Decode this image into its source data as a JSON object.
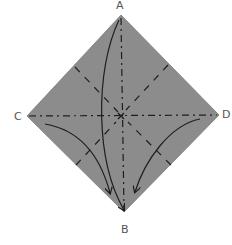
{
  "diagram": {
    "colors": {
      "paper": "#8c8c8c",
      "lines": "#1e1e1e",
      "labels": "#555555",
      "background": "#ffffff"
    },
    "vertices": {
      "A": {
        "label": "A",
        "x": 121,
        "y": 15
      },
      "B": {
        "label": "B",
        "x": 124,
        "y": 212
      },
      "C": {
        "label": "C",
        "x": 27,
        "y": 116
      },
      "D": {
        "label": "D",
        "x": 219,
        "y": 115
      }
    },
    "folds": [
      {
        "type": "mountain",
        "style": "dash-dot",
        "from": "C",
        "to": "D"
      },
      {
        "type": "mountain",
        "style": "dash-dot",
        "from": "A",
        "to": "B"
      },
      {
        "type": "valley",
        "style": "dashed",
        "from": "edge-AC-midpoint",
        "to": "center"
      },
      {
        "type": "valley",
        "style": "dashed",
        "from": "edge-AD-midpoint",
        "to": "center"
      },
      {
        "type": "valley",
        "style": "dashed",
        "from": "edge-CB-midpoint",
        "to": "center"
      },
      {
        "type": "valley",
        "style": "dashed",
        "from": "edge-DB-midpoint",
        "to": "center"
      }
    ],
    "arrows": [
      {
        "from": "A",
        "to": "B",
        "curve": "left"
      },
      {
        "from": "C",
        "to": "B",
        "curve": "down"
      },
      {
        "from": "D",
        "to": "B",
        "curve": "down"
      }
    ]
  }
}
